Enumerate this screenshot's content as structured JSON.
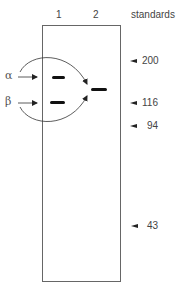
{
  "figure": {
    "lanes": [
      {
        "label": "1"
      },
      {
        "label": "2"
      }
    ],
    "standards_header": "standards",
    "markers": [
      {
        "label": "200",
        "y": 61
      },
      {
        "label": "116",
        "y": 103
      },
      {
        "label": "94",
        "y": 126
      },
      {
        "label": "43",
        "y": 226
      }
    ],
    "subunits": [
      {
        "symbol": "α",
        "lane": 1,
        "band_y": 77
      },
      {
        "symbol": "β",
        "lane": 1,
        "band_y": 102
      }
    ],
    "lane2_band": {
      "description": "combined αβ band",
      "y": 89
    },
    "colors": {
      "band": "#111111",
      "outline": "#666666",
      "text": "#444444"
    }
  }
}
